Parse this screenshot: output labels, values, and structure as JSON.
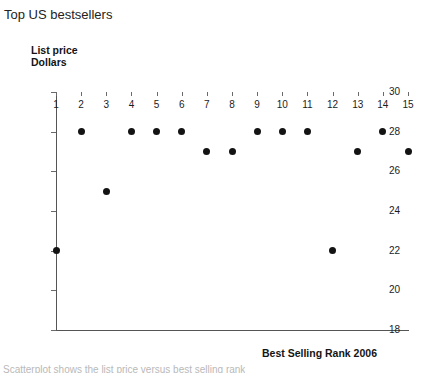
{
  "figure": {
    "title": "Top US bestsellers",
    "bottom_caption": "Scatterplot shows the list price versus best selling rank"
  },
  "chart_data": {
    "type": "scatter",
    "title": "Top US bestsellers",
    "xlabel": "Best Selling Rank 2006",
    "ylabel": "List price Dollars",
    "ylabel_lines": [
      "List price",
      "Dollars"
    ],
    "xlim": [
      1,
      15
    ],
    "ylim": [
      18,
      30
    ],
    "xticks": [
      1,
      2,
      3,
      4,
      5,
      6,
      7,
      8,
      9,
      10,
      11,
      12,
      13,
      14,
      15
    ],
    "yticks": [
      18,
      20,
      22,
      24,
      26,
      28,
      30
    ],
    "grid": false,
    "legend": null,
    "marker": {
      "shape": "circle",
      "filled": true,
      "color": "#131313",
      "size_px": 7
    },
    "x": [
      1,
      2,
      3,
      4,
      5,
      6,
      7,
      8,
      9,
      10,
      11,
      12,
      13,
      14,
      15
    ],
    "y": [
      22,
      28,
      25,
      28,
      28,
      28,
      27,
      27,
      28,
      28,
      28,
      22,
      27,
      28,
      27
    ],
    "points": [
      {
        "rank": 1,
        "price": 22
      },
      {
        "rank": 2,
        "price": 28
      },
      {
        "rank": 3,
        "price": 25
      },
      {
        "rank": 4,
        "price": 28
      },
      {
        "rank": 5,
        "price": 28
      },
      {
        "rank": 6,
        "price": 28
      },
      {
        "rank": 7,
        "price": 27
      },
      {
        "rank": 8,
        "price": 27
      },
      {
        "rank": 9,
        "price": 28
      },
      {
        "rank": 10,
        "price": 28
      },
      {
        "rank": 11,
        "price": 28
      },
      {
        "rank": 12,
        "price": 22
      },
      {
        "rank": 13,
        "price": 27
      },
      {
        "rank": 14,
        "price": 28
      },
      {
        "rank": 15,
        "price": 27
      }
    ]
  }
}
